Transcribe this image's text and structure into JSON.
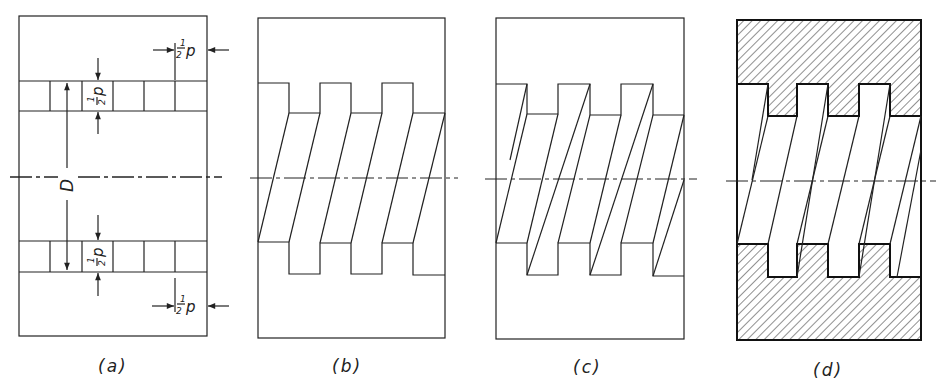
{
  "figure": {
    "panels": [
      {
        "id": "a",
        "label": "(a)",
        "description": "Thread profile layout with dimensions"
      },
      {
        "id": "b",
        "label": "(b)",
        "description": "Helix lines joining thread crests and roots"
      },
      {
        "id": "c",
        "label": "(c)",
        "description": "Thread flanks with doubled slanted lines"
      },
      {
        "id": "d",
        "label": "(d)",
        "description": "Sectioned internal thread with hatching"
      }
    ],
    "dimensions": {
      "half_pitch_top": {
        "num": "1",
        "den": "2",
        "var": "p"
      },
      "half_pitch_depth_upper": {
        "num": "1",
        "den": "2",
        "var": "p"
      },
      "diameter": "D",
      "half_pitch_depth_lower": {
        "num": "1",
        "den": "2",
        "var": "p"
      },
      "half_pitch_bottom": {
        "num": "1",
        "den": "2",
        "var": "p"
      }
    },
    "colors": {
      "line": "#222222",
      "background": "#ffffff"
    }
  }
}
